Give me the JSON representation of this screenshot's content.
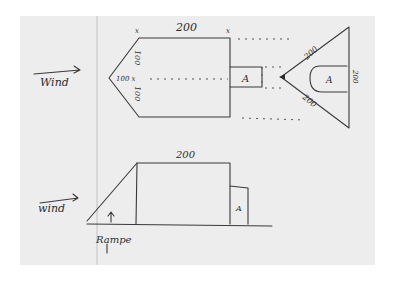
{
  "diagram": {
    "type": "hand-drawn sketch",
    "top_view": {
      "wind_label": "Wind",
      "top_length_label": "200",
      "left_upper_label": "100",
      "left_lower_label": "100",
      "nose_label": "100 x",
      "module_label": "A",
      "tail_upper_label": "200",
      "tail_lower_label": "200",
      "tail_base_label": "200",
      "tail_module_label": "A",
      "corner_mark": "x"
    },
    "side_view": {
      "wind_label": "wind",
      "top_length_label": "200",
      "module_label": "A",
      "ramp_label": "Rampe"
    }
  },
  "colors": {
    "paper": "#ededed",
    "ink": "#3a3a3a",
    "margin_line": "#b8b8b8"
  }
}
